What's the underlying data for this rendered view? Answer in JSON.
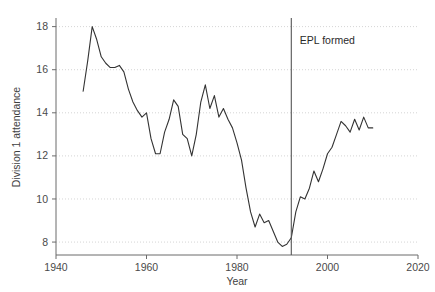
{
  "chart_data": {
    "type": "line",
    "title": "",
    "xlabel": "Year",
    "ylabel": "Division 1 attendance",
    "xlim": [
      1940,
      2020
    ],
    "ylim": [
      7.4,
      18.4
    ],
    "xticks": [
      1940,
      1960,
      1980,
      2000,
      2020
    ],
    "yticks": [
      8,
      10,
      12,
      14,
      16,
      18
    ],
    "grid": "horizontal-dotted",
    "legend": "none",
    "line_color": "#333333",
    "annotations": [
      {
        "label": "EPL formed",
        "x": 1992,
        "type": "vertical-line-with-label",
        "label_x": 1993,
        "label_y": 17.2
      }
    ],
    "x": [
      1946,
      1947,
      1948,
      1949,
      1950,
      1951,
      1952,
      1953,
      1954,
      1955,
      1956,
      1957,
      1958,
      1959,
      1960,
      1961,
      1962,
      1963,
      1964,
      1965,
      1966,
      1967,
      1968,
      1969,
      1970,
      1971,
      1972,
      1973,
      1974,
      1975,
      1976,
      1977,
      1978,
      1979,
      1980,
      1981,
      1982,
      1983,
      1984,
      1985,
      1986,
      1987,
      1988,
      1989,
      1990,
      1991,
      1992,
      1993,
      1994,
      1995,
      1996,
      1997,
      1998,
      1999,
      2000,
      2001,
      2002,
      2003,
      2004,
      2005,
      2006,
      2007,
      2008,
      2009,
      2010
    ],
    "values": [
      15.0,
      16.4,
      18.0,
      17.4,
      16.6,
      16.3,
      16.1,
      16.1,
      16.2,
      15.9,
      15.1,
      14.5,
      14.1,
      13.8,
      14.0,
      12.8,
      12.1,
      12.1,
      13.1,
      13.7,
      14.6,
      14.3,
      13.0,
      12.8,
      12.0,
      13.0,
      14.5,
      15.3,
      14.2,
      14.8,
      13.8,
      14.2,
      13.7,
      13.3,
      12.6,
      11.8,
      10.5,
      9.4,
      8.7,
      9.3,
      8.9,
      9.0,
      8.5,
      8.0,
      7.8,
      7.9,
      8.2,
      9.4,
      10.1,
      10.0,
      10.5,
      11.3,
      10.8,
      11.4,
      12.1,
      12.4,
      13.0,
      13.6,
      13.4,
      13.1,
      13.7,
      13.2,
      13.8,
      13.3,
      13.3
    ]
  },
  "axes": {
    "x_axis_name": "Year",
    "y_axis_name": "Division 1 attendance",
    "x_tick_labels": [
      "1940",
      "1960",
      "1980",
      "2000",
      "2020"
    ],
    "y_tick_labels": [
      "8",
      "10",
      "12",
      "14",
      "16",
      "18"
    ]
  },
  "annotation": {
    "epl_label": "EPL formed"
  }
}
